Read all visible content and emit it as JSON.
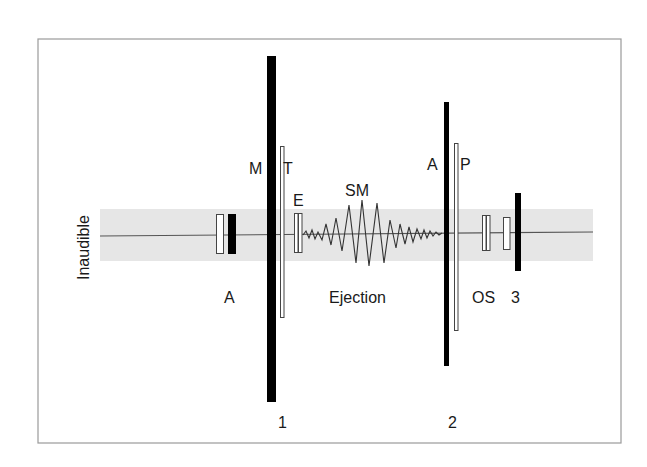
{
  "diagram": {
    "type": "phonocardiogram",
    "colors": {
      "background": "#ffffff",
      "frame": "#9a9a9a",
      "band": "#e6e6e6",
      "baseline": "#555555",
      "bar": "#000000",
      "outline": "#444444",
      "text": "#1a1a1a"
    },
    "labels": {
      "inaudible": "Inaudible",
      "atrial": "A",
      "mitral": "M",
      "tricuspid": "T",
      "ejection_click": "E",
      "systolic_murmur": "SM",
      "ejection": "Ejection",
      "aortic": "A",
      "pulmonic": "P",
      "opening_snap": "OS",
      "third_sound": "3",
      "s1": "1",
      "s2": "2"
    },
    "components": [
      {
        "id": "s4-outline",
        "kind": "outline-rect",
        "x": 216,
        "y": 214,
        "w": 8,
        "h": 40
      },
      {
        "id": "s4-solid",
        "kind": "solid-rect",
        "x": 228,
        "y": 214,
        "w": 8,
        "h": 40
      },
      {
        "id": "s1-mitral",
        "kind": "solid-rect",
        "x": 267,
        "y": 56,
        "w": 9,
        "h": 346
      },
      {
        "id": "s1-tricuspid",
        "kind": "outline-rect",
        "x": 280,
        "y": 146,
        "w": 4,
        "h": 171
      },
      {
        "id": "ejection-click-a",
        "kind": "outline-rect",
        "x": 294,
        "y": 213,
        "w": 4,
        "h": 40
      },
      {
        "id": "ejection-click-b",
        "kind": "outline-rect",
        "x": 298,
        "y": 213,
        "w": 4,
        "h": 40
      },
      {
        "id": "s2-aortic",
        "kind": "solid-rect",
        "x": 444,
        "y": 102,
        "w": 5,
        "h": 264
      },
      {
        "id": "s2-pulmonic",
        "kind": "outline-rect",
        "x": 454,
        "y": 143,
        "w": 4,
        "h": 187
      },
      {
        "id": "os-a",
        "kind": "outline-rect",
        "x": 482,
        "y": 215,
        "w": 4,
        "h": 35
      },
      {
        "id": "os-b",
        "kind": "outline-rect",
        "x": 486,
        "y": 215,
        "w": 4,
        "h": 35
      },
      {
        "id": "s3-outline",
        "kind": "outline-rect",
        "x": 503,
        "y": 217,
        "w": 7,
        "h": 33
      },
      {
        "id": "s3-solid",
        "kind": "solid-rect",
        "x": 515,
        "y": 193,
        "w": 6,
        "h": 78
      }
    ]
  }
}
